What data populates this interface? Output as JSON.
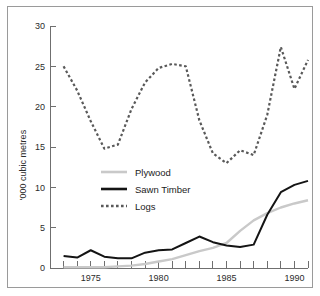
{
  "figure": {
    "border_color": "#9a9a9a",
    "background": "#ffffff"
  },
  "axis": {
    "y_title": "'000 cubic metres",
    "y_ticks": [
      "0",
      "5",
      "10",
      "15",
      "20",
      "25",
      "30"
    ],
    "x_ticks_labeled": [
      "1975",
      "1980",
      "1985",
      "1990"
    ]
  },
  "legend": {
    "items": [
      {
        "label": "Plywood",
        "color": "#c9c9c9",
        "style": "solid"
      },
      {
        "label": "Sawn Timber",
        "color": "#141414",
        "style": "solid"
      },
      {
        "label": "Logs",
        "color": "#595959",
        "style": "dashed"
      }
    ]
  },
  "chart_data": {
    "type": "line",
    "title": "",
    "xlabel": "",
    "ylabel": "'000 cubic metres",
    "xlim": [
      1972,
      1991
    ],
    "ylim": [
      0,
      30
    ],
    "yticks": [
      0,
      5,
      10,
      15,
      20,
      25,
      30
    ],
    "xticks_labeled": [
      1975,
      1980,
      1985,
      1990
    ],
    "xticks_all": [
      1973,
      1974,
      1975,
      1976,
      1977,
      1978,
      1979,
      1980,
      1981,
      1982,
      1983,
      1984,
      1985,
      1986,
      1987,
      1988,
      1989,
      1990,
      1991
    ],
    "grid": false,
    "legend_position": "center-left",
    "x": [
      1973,
      1974,
      1975,
      1976,
      1977,
      1978,
      1979,
      1980,
      1981,
      1982,
      1983,
      1984,
      1985,
      1986,
      1987,
      1988,
      1989,
      1990,
      1991
    ],
    "series": [
      {
        "name": "Logs",
        "color": "#595959",
        "style": "dashed",
        "values": [
          25.0,
          22.0,
          18.2,
          14.8,
          15.3,
          19.7,
          23.0,
          24.8,
          25.3,
          25.0,
          18.3,
          14.2,
          13.0,
          14.6,
          14.0,
          19.0,
          27.4,
          22.2,
          25.8
        ]
      },
      {
        "name": "Sawn Timber",
        "color": "#141414",
        "style": "solid",
        "values": [
          1.5,
          1.3,
          2.2,
          1.4,
          1.2,
          1.2,
          1.9,
          2.2,
          2.3,
          3.1,
          3.9,
          3.2,
          2.8,
          2.6,
          2.9,
          6.6,
          9.4,
          10.3,
          10.8
        ]
      },
      {
        "name": "Plywood",
        "color": "#c9c9c9",
        "style": "solid",
        "values": [
          0.1,
          0.1,
          0.1,
          0.1,
          0.2,
          0.3,
          0.5,
          0.8,
          1.1,
          1.6,
          2.1,
          2.5,
          3.1,
          4.6,
          5.9,
          6.8,
          7.5,
          8.0,
          8.4
        ]
      }
    ]
  }
}
